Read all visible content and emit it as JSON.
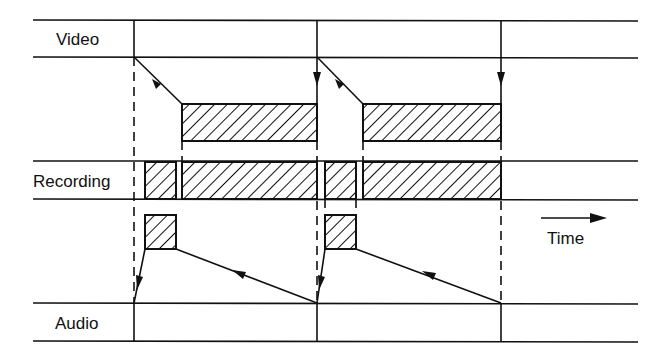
{
  "diagram": {
    "type": "timing-diagram",
    "rows": [
      {
        "id": "video",
        "label": "Video"
      },
      {
        "id": "recording",
        "label": "Recording"
      },
      {
        "id": "audio",
        "label": "Audio"
      }
    ],
    "time_axis": {
      "label": "Time",
      "direction": "right"
    },
    "cycles": [
      {
        "index": 1,
        "video_block": "hatched",
        "recording_blocks": [
          "audio-segment",
          "video-segment"
        ],
        "audio_block": "hatched"
      },
      {
        "index": 2,
        "video_block": "hatched",
        "recording_blocks": [
          "audio-segment",
          "video-segment"
        ],
        "audio_block": "hatched"
      }
    ]
  },
  "labels": {
    "video": "Video",
    "recording": "Recording",
    "audio": "Audio",
    "time": "Time"
  },
  "colors": {
    "ink": "#111111",
    "background": "#ffffff"
  }
}
